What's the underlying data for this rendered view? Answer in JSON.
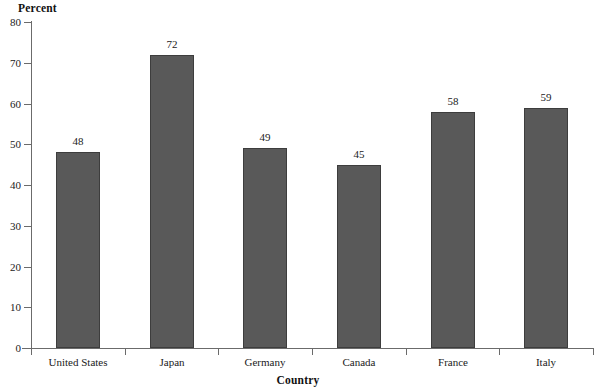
{
  "chart_data": {
    "type": "bar",
    "title": "",
    "xlabel": "Country",
    "ylabel": "Percent",
    "categories": [
      "United States",
      "Japan",
      "Germany",
      "Canada",
      "France",
      "Italy"
    ],
    "values": [
      48,
      72,
      49,
      45,
      58,
      59
    ],
    "value_labels": [
      "48",
      "72",
      "49",
      "45",
      "58",
      "59"
    ],
    "ylim": [
      0,
      80
    ],
    "yticks": [
      0,
      10,
      20,
      30,
      40,
      50,
      60,
      70,
      80
    ],
    "ytick_labels": [
      "0",
      "10",
      "20",
      "30",
      "40",
      "50",
      "60",
      "70",
      "80"
    ],
    "grid": false,
    "legend": null,
    "legend_position": "none",
    "bar_color": "#595959",
    "bar_edge_color": "#3d3d3d",
    "axis_color": "#6b6b6b",
    "text_color": "#1a1a1a",
    "background": "#ffffff"
  }
}
